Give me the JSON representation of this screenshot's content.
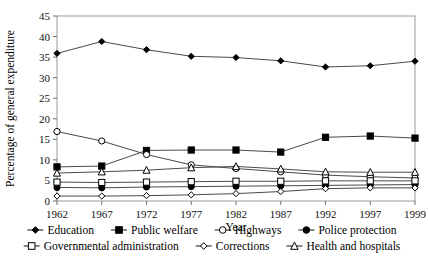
{
  "chart_data": {
    "type": "line",
    "title": "",
    "xlabel": "Year",
    "ylabel": "Percentage of general expenditure",
    "categories": [
      "1962",
      "1967",
      "1972",
      "1977",
      "1982",
      "1987",
      "1992",
      "1997",
      "1999"
    ],
    "x": [
      1962,
      1967,
      1972,
      1977,
      1982,
      1987,
      1992,
      1997,
      1999
    ],
    "ylim": [
      0,
      45
    ],
    "yticks": [
      0,
      5,
      10,
      15,
      20,
      25,
      30,
      35,
      40,
      45
    ],
    "grid": false,
    "legend_position": "bottom",
    "series": [
      {
        "name": "Education",
        "marker": "filled-diamond",
        "values": [
          35.9,
          38.8,
          36.8,
          35.2,
          34.9,
          34.1,
          32.6,
          32.9,
          34.0
        ]
      },
      {
        "name": "Public welfare",
        "marker": "filled-square",
        "values": [
          8.3,
          8.5,
          12.3,
          12.4,
          12.4,
          11.9,
          15.5,
          15.8,
          15.3
        ]
      },
      {
        "name": "Highways",
        "marker": "open-circle",
        "values": [
          16.9,
          14.6,
          11.3,
          8.8,
          7.9,
          7.1,
          6.3,
          5.9,
          5.6
        ]
      },
      {
        "name": "Police protection",
        "marker": "filled-circle",
        "values": [
          3.3,
          3.2,
          3.4,
          3.5,
          3.6,
          3.7,
          3.8,
          3.9,
          4.0
        ]
      },
      {
        "name": "Governmental administration",
        "marker": "open-square",
        "values": [
          4.6,
          4.5,
          4.6,
          4.7,
          4.8,
          4.8,
          4.9,
          4.9,
          4.9
        ]
      },
      {
        "name": "Corrections",
        "marker": "open-diamond",
        "values": [
          1.2,
          1.2,
          1.3,
          1.5,
          1.8,
          2.3,
          3.0,
          3.2,
          3.2
        ]
      },
      {
        "name": "Health and hospitals",
        "marker": "open-triangle",
        "values": [
          6.8,
          7.1,
          7.5,
          8.1,
          8.4,
          7.8,
          7.1,
          7.0,
          7.0
        ]
      }
    ]
  },
  "legend": {
    "row1": [
      "Education",
      "Public welfare",
      "Highways",
      "Police protection"
    ],
    "row2": [
      "Governmental administration",
      "Corrections",
      "Health and hospitals"
    ]
  }
}
